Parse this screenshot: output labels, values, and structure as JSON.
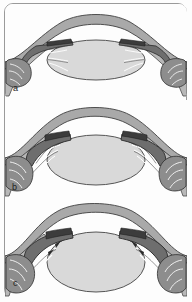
{
  "figure": {
    "frame": {
      "border_color": "#9a9a9a",
      "background": "#fdfdfd",
      "corner_radius_px": 9
    },
    "watermark_text": "",
    "panels": [
      {
        "id": "a",
        "label": "a",
        "caption": "Relaxed ciliary muscle, zonular fibres taut, lens flattened (distance focus)",
        "lens_shape": "flat",
        "cornea_curvature": "shallow"
      },
      {
        "id": "b",
        "label": "b",
        "caption": "Partially contracted ciliary muscle, zonular fibres slackening, lens thickening",
        "lens_shape": "medium",
        "cornea_curvature": "medium"
      },
      {
        "id": "c",
        "label": "c",
        "caption": "Contracted ciliary muscle, zonular fibres slack, lens rounded (near focus)",
        "lens_shape": "round",
        "cornea_curvature": "steep"
      }
    ],
    "structures": [
      {
        "name": "cornea",
        "color": "#a9a9a9"
      },
      {
        "name": "sclera",
        "color": "#b5b5b5"
      },
      {
        "name": "lens",
        "color": "#d9d9d9"
      },
      {
        "name": "ciliary-body",
        "color": "#707070"
      },
      {
        "name": "ciliary-muscle",
        "color": "#8d8d8d"
      },
      {
        "name": "zonular-fibres",
        "color": "#ffffff"
      },
      {
        "name": "outline",
        "color": "#3a3a3a"
      }
    ],
    "colors": {
      "lens_fill": "#d9d9d9",
      "lens_stroke": "#555555",
      "cornea_fill": "#a9a9a9",
      "cornea_stroke": "#4a4a4a",
      "sclera_fill": "#b8b8b8",
      "ciliary_dark": "#6e6e6e",
      "ciliary_mid": "#909090",
      "fiber_white": "#ffffff",
      "ink": "#1c1c1c"
    }
  }
}
